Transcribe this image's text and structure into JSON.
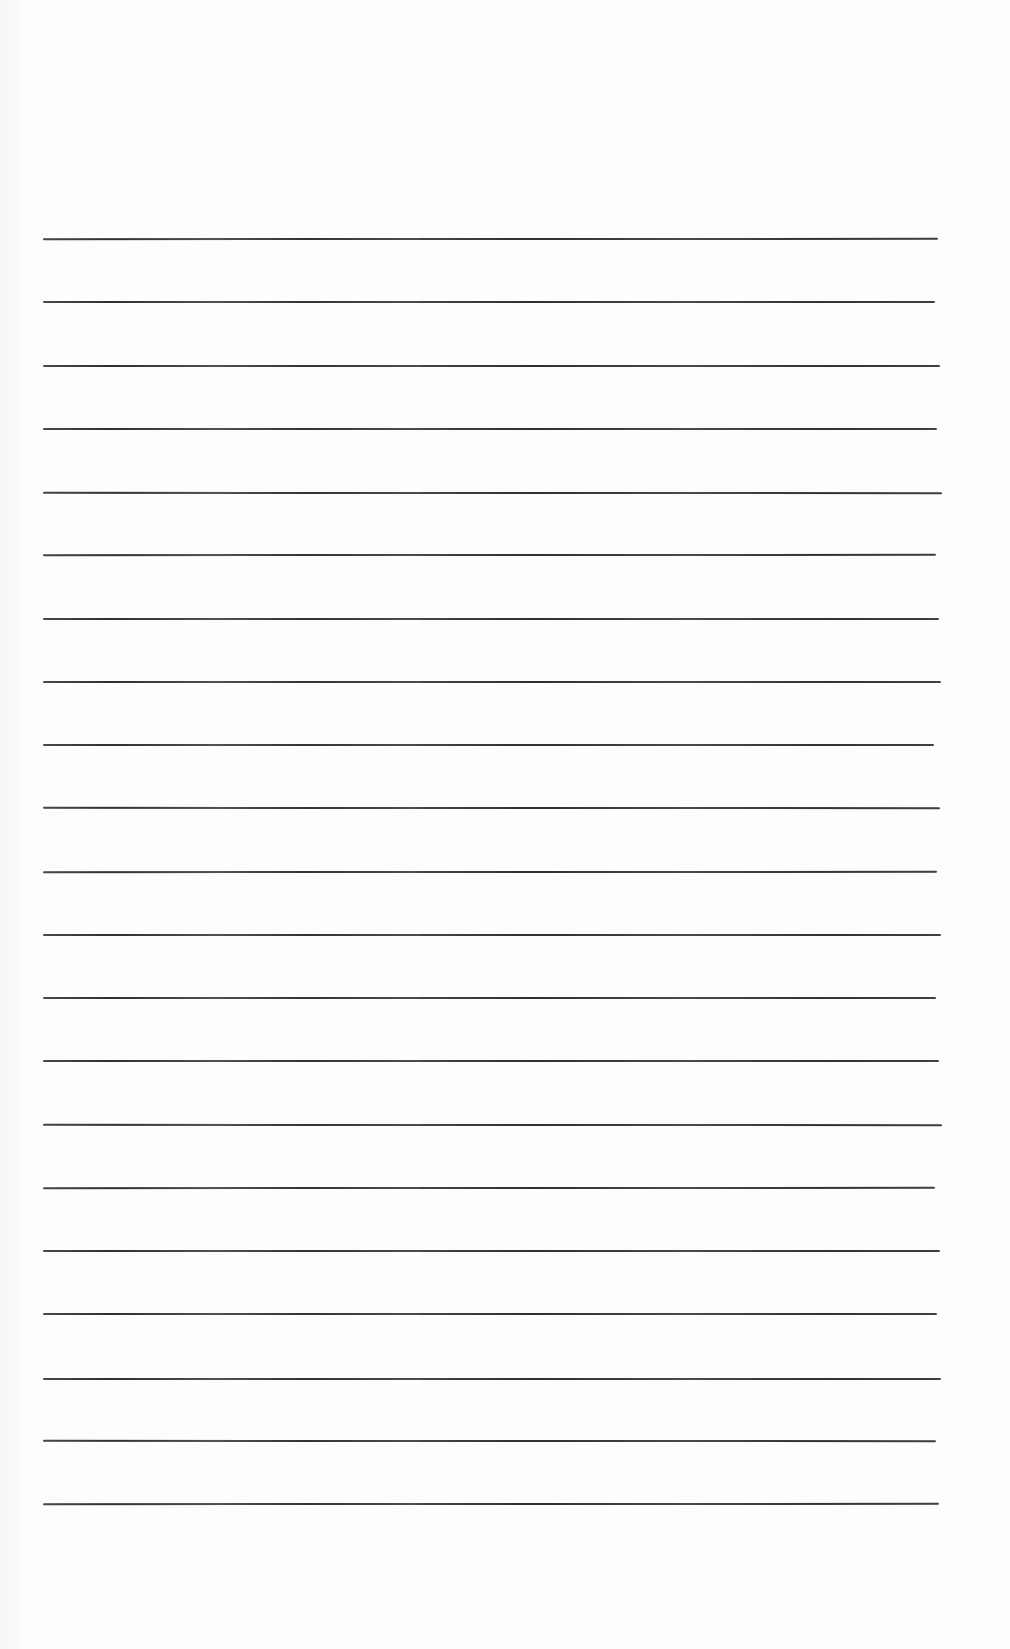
{
  "document": {
    "kind": "scanned-ruled-notebook-page",
    "page_width": 1010,
    "page_height": 1649,
    "background_color": "#fdfdfd",
    "has_text": false,
    "visible_text": "",
    "heading": "",
    "page_number": "",
    "margins": {
      "top": 238,
      "bottom": 146,
      "left": 43,
      "right": 72
    }
  },
  "ruling": {
    "line_color": "#303030",
    "line_thickness_px": 2,
    "line_start_x": 43,
    "line_end_x": 938,
    "line_length_px": 895,
    "first_line_y": 238,
    "line_spacing_px": 63.25,
    "line_count": 21,
    "line_y_positions": [
      238,
      301,
      365,
      428,
      491,
      554,
      618,
      681,
      744,
      807,
      871,
      934,
      997,
      1060,
      1124,
      1187,
      1250,
      1313,
      1377,
      1440,
      1503
    ]
  }
}
